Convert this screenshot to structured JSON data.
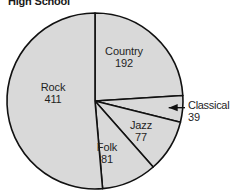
{
  "chart_data": {
    "type": "pie",
    "title": "High School",
    "categories": [
      "Country",
      "Classical",
      "Jazz",
      "Folk",
      "Rock"
    ],
    "values": [
      192,
      39,
      77,
      81,
      411
    ],
    "total": 800,
    "xlabel": "",
    "ylabel": "",
    "grid": false,
    "legend": "none",
    "labels_inside": true,
    "start_angle_deg": 0,
    "direction": "clockwise",
    "slices": [
      {
        "name": "Country",
        "value": 192,
        "label_value": "192",
        "start_deg": 0.0,
        "sweep_deg": 86.4,
        "callout": false
      },
      {
        "name": "Classical",
        "value": 39,
        "label_value": "39",
        "start_deg": 86.4,
        "sweep_deg": 17.55,
        "callout": true
      },
      {
        "name": "Jazz",
        "value": 77,
        "label_value": "77",
        "start_deg": 103.95,
        "sweep_deg": 34.65,
        "callout": false
      },
      {
        "name": "Folk",
        "value": 81,
        "label_value": "81",
        "start_deg": 138.6,
        "sweep_deg": 36.45,
        "callout": false
      },
      {
        "name": "Rock",
        "value": 411,
        "label_value": "411",
        "start_deg": 175.05,
        "sweep_deg": 184.95,
        "callout": false
      }
    ],
    "colors": {
      "slice_fill": "#d9d9d9",
      "slice_outline": "#111111",
      "background": "#ffffff",
      "text": "#1f1f1f",
      "callout_line": "#111111"
    }
  }
}
